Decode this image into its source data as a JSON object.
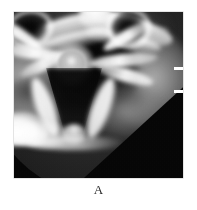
{
  "figure": {
    "panel_label": "A",
    "modality": "CT",
    "view": "axial",
    "anatomy": "cervical vertebra",
    "background_color": "#ffffff",
    "image_frame": {
      "border_color": "#c9c9c9",
      "background_color": "#000000",
      "left": 14,
      "top": 12,
      "width": 169,
      "height": 166
    },
    "field_of_view": {
      "shape": "circle",
      "outside_color": "#000000",
      "cut_corner": "lower-right"
    },
    "markers": {
      "edge_tick_label": "scale-tick",
      "edge_tick_color": "#ffffff",
      "edge_tick_count": 2
    },
    "structures": [
      {
        "name": "anterior-arch",
        "tone": "bright-bone"
      },
      {
        "name": "inner-arch",
        "tone": "bright-bone"
      },
      {
        "name": "transverse-foramen-left",
        "tone": "dark"
      },
      {
        "name": "transverse-foramen-right",
        "tone": "dark"
      },
      {
        "name": "dens-odontoid",
        "tone": "bright-oval"
      },
      {
        "name": "vertebral-canal",
        "tone": "dark"
      },
      {
        "name": "lamina-left",
        "tone": "bright-bone"
      },
      {
        "name": "lamina-right",
        "tone": "bright-bone"
      },
      {
        "name": "spinous-process",
        "tone": "bright-bone"
      },
      {
        "name": "soft-tissue",
        "tone": "mid-gray"
      },
      {
        "name": "positioning-artifact",
        "tone": "saturated-white"
      }
    ]
  }
}
